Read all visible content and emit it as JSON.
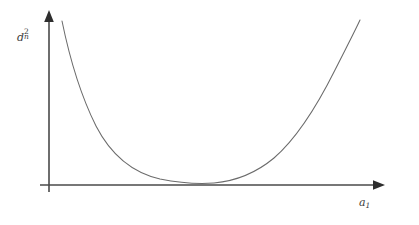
{
  "figure": {
    "background_color": "#ffffff",
    "axis_color": "#4a4a4a",
    "curve_color": "#6b6b6b",
    "y_axis_label": {
      "base": "d",
      "subscript": "n",
      "superscript": "2",
      "plain": "d_n^2"
    },
    "x_axis_label": {
      "base": "a",
      "subscript": "1",
      "superscript": "",
      "plain": "a_1"
    }
  },
  "chart_data": {
    "type": "line",
    "title": "",
    "subtitle": "",
    "xlabel": "a_1",
    "ylabel": "d_n^2",
    "legend": [],
    "legend_position": "none",
    "grid": false,
    "axis_style": "arrowed-half-axes",
    "tick_labels_x": [],
    "tick_labels_y": [],
    "xlim": [
      0,
      1
    ],
    "ylim": [
      0,
      1
    ],
    "annotations": [],
    "series": [
      {
        "name": "d_n^2(a_1)",
        "x": [
          0.04,
          0.06,
          0.08,
          0.1,
          0.13,
          0.16,
          0.2,
          0.25,
          0.3,
          0.35,
          0.4,
          0.45,
          0.49,
          0.53,
          0.58,
          0.63,
          0.68,
          0.73,
          0.78,
          0.83,
          0.87,
          0.9,
          0.93,
          0.95
        ],
        "y": [
          0.96,
          0.79,
          0.66,
          0.56,
          0.44,
          0.35,
          0.255,
          0.16,
          0.098,
          0.055,
          0.028,
          0.012,
          0.006,
          0.008,
          0.023,
          0.052,
          0.097,
          0.16,
          0.25,
          0.375,
          0.505,
          0.62,
          0.77,
          0.9
        ]
      }
    ]
  },
  "geometry": {
    "origin_x": 49,
    "origin_y": 185,
    "y_axis_top": 10,
    "y_axis_bottom": 192,
    "x_axis_left": 40,
    "x_axis_right": 385,
    "curve_path": "M 62,21 C 70,60 82,98 96,126 C 112,157 134,173 160,179 C 180,183 200,184 214,183 C 236,181 256,173 274,158 C 296,139 316,108 335,70 C 345,50 354,33 360,20"
  }
}
